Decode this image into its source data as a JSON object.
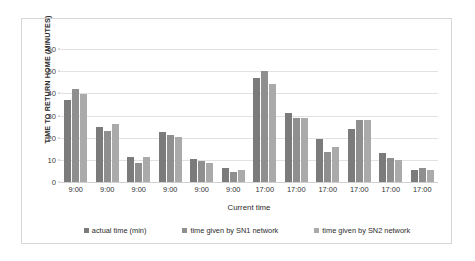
{
  "chart_data": {
    "type": "bar",
    "title": "",
    "xlabel": "Current time",
    "ylabel": "TIME TO RETURN HOME (MINUTES)",
    "ylim": [
      0,
      60
    ],
    "yticks": [
      0,
      10,
      20,
      30,
      40,
      50,
      60
    ],
    "grid": true,
    "legend_position": "bottom",
    "categories": [
      "9:00",
      "9:00",
      "9:00",
      "9:00",
      "9:00",
      "9:00",
      "17:00",
      "17:00",
      "17:00",
      "17:00",
      "17:00",
      "17:00"
    ],
    "series": [
      {
        "name": "actual time (min)",
        "color": "#7b7b7b",
        "values": [
          37,
          25,
          11.5,
          22.5,
          10.5,
          6.5,
          47,
          31,
          19.5,
          24,
          13,
          5.5
        ]
      },
      {
        "name": "time given by SN1 network",
        "color": "#8f8f8f",
        "values": [
          42,
          23,
          8.5,
          21,
          9.5,
          4.5,
          50,
          29,
          13.5,
          28,
          11,
          6.5
        ]
      },
      {
        "name": "time given by SN2 network",
        "color": "#aaaaaa",
        "values": [
          39.5,
          26,
          11.5,
          20.5,
          8.5,
          5.5,
          44,
          29,
          16,
          28,
          10,
          5.5
        ]
      }
    ]
  },
  "legend": {
    "items": [
      {
        "label": "actual time (min)"
      },
      {
        "label": "time given by SN1 network"
      },
      {
        "label": "time given by SN2 network"
      }
    ]
  },
  "axes": {
    "y_title": "TIME TO RETURN HOME (MINUTES)",
    "x_title": "Current time"
  }
}
